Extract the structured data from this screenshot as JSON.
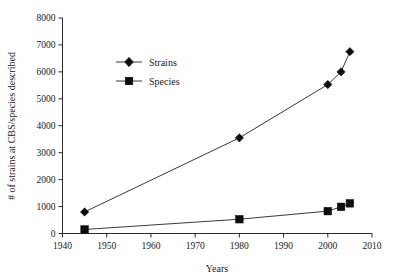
{
  "chart_data": {
    "type": "line",
    "title": "",
    "subtitle": "",
    "xlabel": "Years",
    "ylabel": "# of strains at CBS/species described",
    "xlim": [
      1940,
      2010
    ],
    "ylim": [
      0,
      8000
    ],
    "xticks": [
      1940,
      1950,
      1960,
      1970,
      1980,
      1990,
      2000,
      2010
    ],
    "yticks": [
      0,
      1000,
      2000,
      3000,
      4000,
      5000,
      6000,
      7000,
      8000
    ],
    "xtick_labels": [
      "1940",
      "1950",
      "1960",
      "1970",
      "1980",
      "1990",
      "2000",
      "2010"
    ],
    "ytick_labels": [
      "0",
      "1000",
      "2000",
      "3000",
      "4000",
      "5000",
      "6000",
      "7000",
      "8000"
    ],
    "grid": false,
    "legend_position": "upper left inside",
    "series": [
      {
        "name": "Strains",
        "marker": "diamond",
        "x": [
          1945,
          1980,
          2000,
          2003,
          2005
        ],
        "values": [
          800,
          3550,
          5530,
          6000,
          6750
        ]
      },
      {
        "name": "Species",
        "marker": "square",
        "x": [
          1945,
          1980,
          2000,
          2003,
          2005
        ],
        "values": [
          150,
          530,
          830,
          990,
          1120
        ]
      }
    ]
  },
  "legend": {
    "items": [
      {
        "label": "Strains",
        "marker": "diamond-marker-icon"
      },
      {
        "label": "Species",
        "marker": "square-marker-icon"
      }
    ]
  },
  "axes": {
    "x_title": "Years",
    "y_title": "# of strains at CBS/species described"
  }
}
